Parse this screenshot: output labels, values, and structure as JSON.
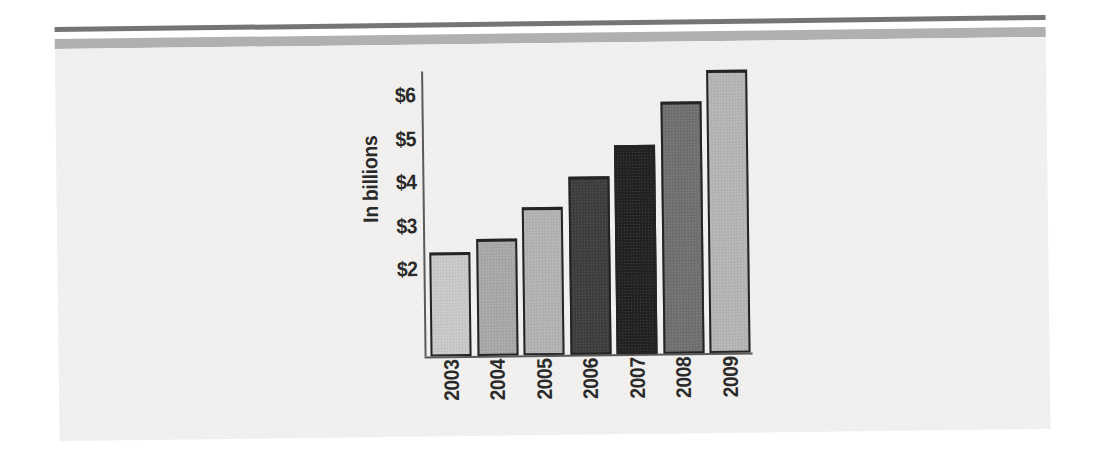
{
  "page": {
    "background_color": "#ffffff",
    "paper_color": "#f2f1ef",
    "top_rule": {
      "dark_color": "#757575",
      "light_color": "#b0b0b0"
    }
  },
  "chart_data": {
    "type": "bar",
    "title": "",
    "xlabel": "",
    "ylabel": "In billions",
    "categories": [
      "2003",
      "2004",
      "2005",
      "2006",
      "2007",
      "2008",
      "2009"
    ],
    "values": [
      2.4,
      2.7,
      3.4,
      4.1,
      4.8,
      5.8,
      6.5
    ],
    "y_ticks": [
      {
        "label": "$2",
        "value": 2
      },
      {
        "label": "$3",
        "value": 3
      },
      {
        "label": "$4",
        "value": 4
      },
      {
        "label": "$5",
        "value": 5
      },
      {
        "label": "$6",
        "value": 6
      }
    ],
    "ylim": [
      0,
      6.55
    ],
    "grid": false,
    "legend": false,
    "bar_colors": [
      "#c9c9c9",
      "#a8a8a8",
      "#b3b3b3",
      "#3e3e3e",
      "#222222",
      "#707070",
      "#b5b5b5"
    ],
    "bar_outline_color": "#242424",
    "axis_color": "#5a5a5a",
    "text_color": "#2a2a2a"
  }
}
